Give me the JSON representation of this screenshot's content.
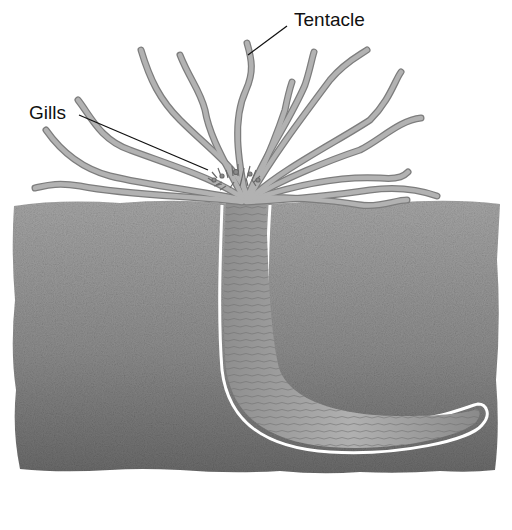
{
  "diagram": {
    "labels": [
      {
        "id": "tentacle",
        "text": "Tentacle"
      },
      {
        "id": "gills",
        "text": "Gills"
      }
    ],
    "colors": {
      "background": "#ffffff",
      "sediment_light": "#a8a8a8",
      "sediment_dark": "#6f6f6f",
      "tentacle_fill": "#a9a9a9",
      "tentacle_stroke": "#7a7a7a",
      "body_fill": "#9b9b9b",
      "burrow_outline": "#ffffff",
      "leader_line": "#111111"
    }
  }
}
